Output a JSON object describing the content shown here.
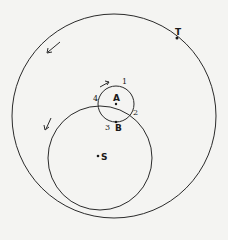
{
  "diagram": {
    "type": "orbital-geometry",
    "circles": [
      {
        "name": "outer-orbit",
        "cx": 114,
        "cy": 116,
        "r": 102
      },
      {
        "name": "sun-orbit",
        "cx": 100,
        "cy": 158,
        "r": 52
      },
      {
        "name": "small-orbit-A",
        "cx": 116,
        "cy": 104,
        "r": 18
      }
    ],
    "labels": {
      "T": "T",
      "A": "A",
      "B": "B",
      "S": "S",
      "p1": "1",
      "p2": "2",
      "p3": "3",
      "p4": "4"
    },
    "colors": {
      "stroke": "#2a2a2a",
      "background": "#f4f4f2"
    }
  }
}
